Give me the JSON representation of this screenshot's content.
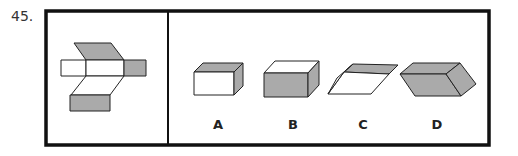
{
  "question": {
    "number": "45.",
    "net_description": "unfolded box net with shaded faces",
    "options": [
      {
        "label": "A",
        "description": "box with shaded top and right side"
      },
      {
        "label": "B",
        "description": "box with shaded front and right side"
      },
      {
        "label": "C",
        "description": "flattened box with shaded top"
      },
      {
        "label": "D",
        "description": "rhombic box with shaded faces"
      }
    ]
  },
  "colors": {
    "shade": "#aaaaaa",
    "line": "#222222",
    "frame": "#111111"
  }
}
